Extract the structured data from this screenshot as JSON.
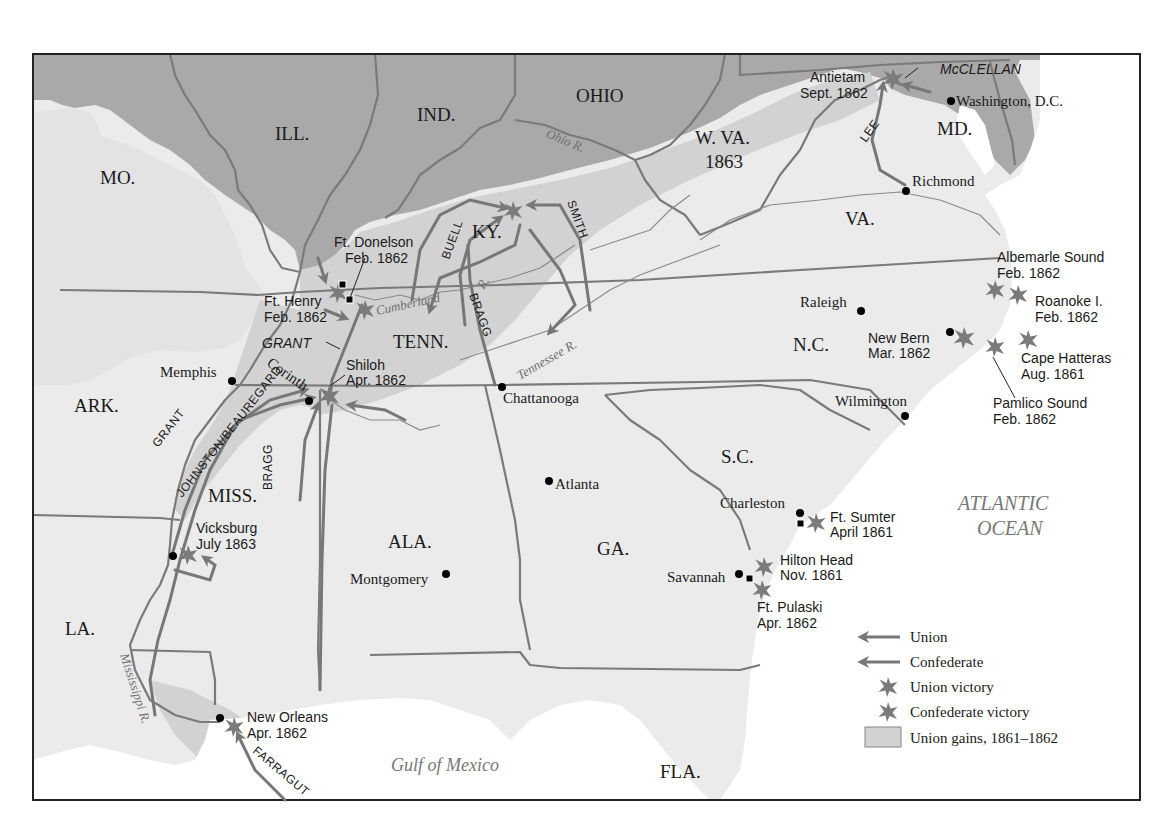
{
  "map": {
    "colors": {
      "union_states": "#a9a9a9",
      "confederate_states": "#ebebeb",
      "union_gains": "#d2d2d2",
      "water": "#ffffff",
      "border": "#7a7a7a",
      "arrow": "#777777",
      "star": "#7b7b7b"
    },
    "states": {
      "mo": "MO.",
      "ill": "ILL.",
      "ind": "IND.",
      "ohio": "OHIO",
      "wva": "W. VA.",
      "wva_year": "1863",
      "md": "MD.",
      "va": "VA.",
      "ky": "KY.",
      "tenn": "TENN.",
      "nc": "N.C.",
      "ark": "ARK.",
      "miss": "MISS.",
      "ala": "ALA.",
      "ga": "GA.",
      "sc": "S.C.",
      "la": "LA.",
      "fla": "FLA."
    },
    "water": {
      "atlantic_line1": "ATLANTIC",
      "atlantic_line2": "OCEAN",
      "gulf": "Gulf of Mexico"
    },
    "rivers": {
      "ohio": "Ohio R.",
      "cumberland": "Cumberland",
      "cumberland_r": "R.",
      "tennessee": "Tennessee R.",
      "mississippi": "Mississippi R."
    },
    "cities": {
      "washington": "Washington, D.C.",
      "richmond": "Richmond",
      "raleigh": "Raleigh",
      "wilmington": "Wilmington",
      "memphis": "Memphis",
      "corinth": "Corinth",
      "chattanooga": "Chattanooga",
      "atlanta": "Atlanta",
      "montgomery": "Montgomery",
      "charleston": "Charleston",
      "savannah": "Savannah"
    },
    "battles": [
      {
        "name": "Antietam",
        "date": "Sept. 1862"
      },
      {
        "name": "Ft. Donelson",
        "date": "Feb. 1862"
      },
      {
        "name": "Ft. Henry",
        "date": "Feb. 1862"
      },
      {
        "name": "Shiloh",
        "date": "Apr. 1862"
      },
      {
        "name": "Vicksburg",
        "date": "July 1863"
      },
      {
        "name": "New Orleans",
        "date": "Apr. 1862"
      },
      {
        "name": "Albemarle Sound",
        "date": "Feb. 1862"
      },
      {
        "name": "Roanoke I.",
        "date": "Feb. 1862"
      },
      {
        "name": "New Bern",
        "date": "Mar. 1862"
      },
      {
        "name": "Cape Hatteras",
        "date": "Aug. 1861"
      },
      {
        "name": "Pamlico Sound",
        "date": "Feb. 1862"
      },
      {
        "name": "Ft. Sumter",
        "date": "April 1861"
      },
      {
        "name": "Hilton Head",
        "date": "Nov. 1861"
      },
      {
        "name": "Ft. Pulaski",
        "date": "Apr. 1862"
      }
    ],
    "generals": {
      "mcclellan": "McCLELLAN",
      "lee": "LEE",
      "buell": "BUELL",
      "smith": "SMITH",
      "bragg_ky": "BRAGG",
      "grant_tenn": "GRANT",
      "grant_miss": "GRANT",
      "johnston_beauregard": "JOHNSTON/BEAUREGARD",
      "bragg_miss": "BRAGG",
      "farragut": "FARRAGUT"
    }
  },
  "legend": {
    "items": [
      {
        "label": "Union",
        "symbol": "arrow-union"
      },
      {
        "label": "Confederate",
        "symbol": "arrow-confederate"
      },
      {
        "label": "Union victory",
        "symbol": "star-union"
      },
      {
        "label": "Confederate victory",
        "symbol": "star-confederate"
      },
      {
        "label": "Union gains, 1861–1862",
        "symbol": "swatch-union-gains"
      }
    ]
  }
}
